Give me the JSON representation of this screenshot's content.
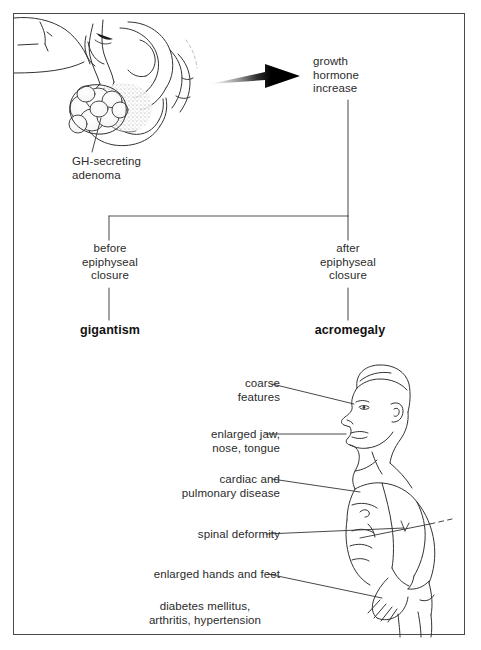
{
  "figure": {
    "type": "medical-pathophysiology-flow-diagram",
    "border_color": "#4a4a4a",
    "ink_color": "#2b2b2b",
    "background_color": "#ffffff"
  },
  "anatomy_panel": {
    "name": "sagittal section of sella turcica with pituitary adenoma",
    "label": "GH-secreting\nadenoma"
  },
  "arrow": {
    "name": "gradient-arrow",
    "direction": "right",
    "style": "faded tail to solid black head"
  },
  "flow": {
    "root": {
      "label": "growth\nhormone\nincrease"
    },
    "branches": [
      {
        "condition": "before\nepiphyseal\nclosure",
        "outcome": "gigantism",
        "side": "left"
      },
      {
        "condition": "after\nepiphyseal\nclosure",
        "outcome": "acromegaly",
        "side": "right"
      }
    ]
  },
  "patient_panel": {
    "name": "male acromegaly patient in profile, facing left",
    "findings": [
      {
        "id": "coarse",
        "text": "coarse\nfeatures"
      },
      {
        "id": "jaw",
        "text": "enlarged jaw,\nnose, tongue"
      },
      {
        "id": "cardiac",
        "text": "cardiac and\npulmonary disease"
      },
      {
        "id": "spinal",
        "text": "spinal deformity"
      },
      {
        "id": "hands",
        "text": "enlarged hands and feet"
      },
      {
        "id": "diabetes",
        "text": "diabetes mellitus,\narthritis, hypertension"
      }
    ]
  }
}
